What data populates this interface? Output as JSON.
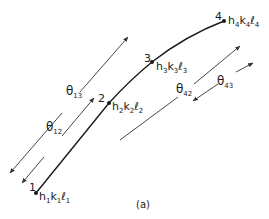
{
  "diagram": {
    "caption": "(a)",
    "colors": {
      "line": "#1a1a1a",
      "arrow": "#333333",
      "background": "#ffffff"
    },
    "points": [
      {
        "id": "1",
        "label": "1",
        "h": "h",
        "hs": "1",
        "k": "k",
        "ks": "1",
        "l": "ℓ",
        "ls": "1"
      },
      {
        "id": "2",
        "label": "2",
        "h": "h",
        "hs": "2",
        "k": "k",
        "ks": "2",
        "l": "ℓ",
        "ls": "2"
      },
      {
        "id": "3",
        "label": "3",
        "h": "h",
        "hs": "3",
        "k": "k",
        "ks": "3",
        "l": "ℓ",
        "ls": "3"
      },
      {
        "id": "4",
        "label": "4",
        "h": "h",
        "hs": "4",
        "k": "k",
        "ks": "4",
        "l": "ℓ",
        "ls": "4"
      }
    ],
    "angles": [
      {
        "id": "theta13",
        "symbol": "θ",
        "sub": "13"
      },
      {
        "id": "theta12",
        "symbol": "θ",
        "sub": "12"
      },
      {
        "id": "theta42",
        "symbol": "θ",
        "sub": "42"
      },
      {
        "id": "theta43",
        "symbol": "θ",
        "sub": "43"
      }
    ]
  }
}
